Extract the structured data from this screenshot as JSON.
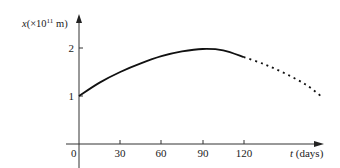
{
  "chart_data": {
    "type": "line",
    "title": "",
    "xlabel": "t (days)",
    "ylabel": "x (×10^11 m)",
    "x_ticks": [
      0,
      30,
      60,
      90,
      120
    ],
    "y_ticks": [
      1,
      2
    ],
    "xlim": [
      0,
      180
    ],
    "ylim": [
      0,
      2.5
    ],
    "grid": false,
    "series": [
      {
        "name": "measured",
        "style": "solid",
        "x": [
          0,
          15,
          30,
          45,
          60,
          75,
          90,
          105,
          120
        ],
        "y": [
          1.0,
          1.28,
          1.5,
          1.68,
          1.83,
          1.93,
          1.98,
          1.95,
          1.81
        ]
      },
      {
        "name": "extrapolated",
        "style": "dotted",
        "x": [
          120,
          135,
          150,
          165,
          177
        ],
        "y": [
          1.81,
          1.66,
          1.47,
          1.24,
          0.98
        ]
      }
    ]
  },
  "labels": {
    "y_var": "x",
    "y_unit_pre": "(×10",
    "y_unit_exp": "11",
    "y_unit_post": " m)",
    "x_var": "t",
    "x_unit": " (days)",
    "origin": "0",
    "xtick_labels": [
      "30",
      "60",
      "90",
      "120"
    ],
    "ytick_labels": [
      "1",
      "2"
    ]
  }
}
